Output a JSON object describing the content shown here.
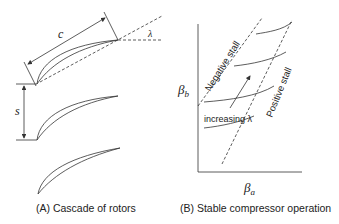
{
  "panel_a": {
    "caption": "(A) Cascade of rotors",
    "chord_label": "c",
    "stagger_label": "λ",
    "spacing_label": "s"
  },
  "panel_b": {
    "caption": "(B) Stable compressor operation",
    "y_axis_label": "β",
    "y_axis_sub": "b",
    "x_axis_label": "β",
    "x_axis_sub": "a",
    "negative_stall_label": "Negative stall",
    "positive_stall_label": "Positive stall",
    "arrow_label": "increasing λ"
  },
  "colors": {
    "stroke": "#333333",
    "text": "#222222"
  }
}
